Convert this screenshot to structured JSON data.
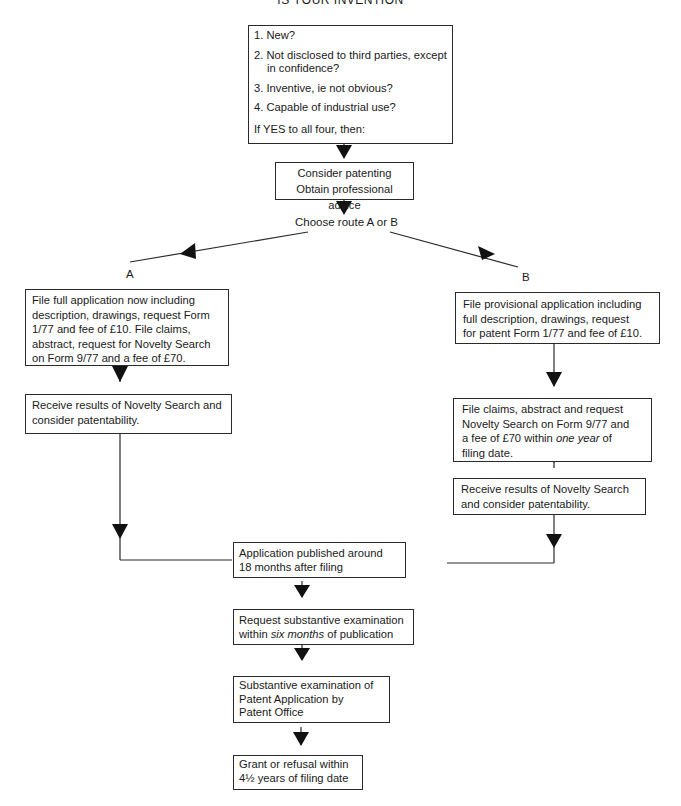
{
  "title": "IS YOUR INVENTION",
  "questions": {
    "items": [
      {
        "n": "1.",
        "text": "New?"
      },
      {
        "n": "2.",
        "text": "Not disclosed to third parties, except",
        "cont": "in confidence?"
      },
      {
        "n": "3.",
        "text": "Inventive, ie not obvious?"
      },
      {
        "n": "4.",
        "text": "Capable of industrial use?"
      }
    ],
    "conclusion": "If YES to all four, then:"
  },
  "consider": {
    "line1": "Consider patenting",
    "line2": "Obtain professional advice"
  },
  "choose_route": "Choose route A or B",
  "route_a": {
    "label": "A",
    "step1": {
      "lines": [
        "File full application now including",
        "description, drawings, request Form",
        "1/77 and fee of £10. File claims,",
        "abstract, request for Novelty Search",
        "on Form 9/77 and a fee of £70."
      ]
    },
    "step2": {
      "lines": [
        "Receive results of Novelty Search and",
        "consider patentability."
      ]
    }
  },
  "route_b": {
    "label": "B",
    "step1": {
      "lines": [
        "File provisional application including",
        "full description, drawings, request",
        "for patent Form 1/77 and fee of £10."
      ]
    },
    "step2": {
      "line1": "File claims, abstract and request",
      "line2": "Novelty Search on Form 9/77 and",
      "line3_pre": "a fee of £70 within ",
      "line3_em": "one year",
      "line3_post": " of",
      "line4": "filing date."
    },
    "step3": {
      "lines": [
        "Receive results of Novelty Search",
        "and consider patentability."
      ]
    }
  },
  "published": {
    "lines": [
      "Application published around",
      "18 months after filing"
    ]
  },
  "request_exam": {
    "line1": "Request substantive examination",
    "line2_pre": "within ",
    "line2_em": "six months",
    "line2_post": " of publication"
  },
  "exam": {
    "lines": [
      "Substantive examination of",
      "Patent Application by",
      "Patent Office"
    ]
  },
  "grant": {
    "lines": [
      "Grant or refusal within",
      "4½ years of filing date"
    ]
  },
  "colors": {
    "line": "#2a2a2a",
    "arrow": "#111111",
    "background": "#ffffff"
  }
}
